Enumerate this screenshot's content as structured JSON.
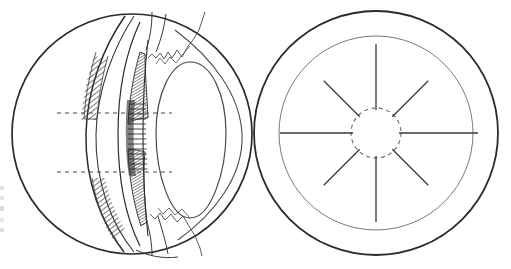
{
  "figure": {
    "caption": "",
    "background_color": "#ffffff",
    "ink_color": "#2b2b2b",
    "fine_ink_color": "#555555",
    "hatch_color": "#4a4a4a",
    "width": 511,
    "height": 269
  },
  "panels": [
    {
      "id": "left-panel",
      "name": "sagittal-section-of-eyeball",
      "label": "",
      "center": {
        "x": 132,
        "y": 134
      },
      "radius": 121,
      "elements": [
        {
          "name": "globe-outline",
          "type": "circle",
          "stroke": "#2b2b2b",
          "stroke_width": 1.6
        },
        {
          "name": "cornea-arc",
          "type": "arc",
          "stroke": "#2b2b2b",
          "stroke_width": 1.2
        },
        {
          "name": "anterior-chamber-arc",
          "type": "arc",
          "stroke": "#2b2b2b",
          "stroke_width": 1.1
        },
        {
          "name": "iris-hatched-band-superior",
          "type": "hatched-crescent",
          "hatch_angle_deg": 50
        },
        {
          "name": "iris-hatched-band-inferior",
          "type": "hatched-crescent",
          "hatch_angle_deg": 50
        },
        {
          "name": "ciliary-body-stipple-superior",
          "type": "stipple-wedge"
        },
        {
          "name": "ciliary-body-stipple-inferior",
          "type": "stipple-wedge"
        },
        {
          "name": "zonular-fiber-comb",
          "type": "fiber-bundle",
          "fiber_count": 30
        },
        {
          "name": "lens-outline",
          "type": "lens-ellipse",
          "stroke": "#4a4a4a"
        },
        {
          "name": "vitreous-boundary-arc",
          "type": "arc",
          "stroke": "#4a4a4a"
        },
        {
          "name": "optic-axis-marker-superior",
          "type": "dashed-line",
          "y": 113
        },
        {
          "name": "optic-axis-marker-inferior",
          "type": "dashed-line",
          "y": 172
        }
      ],
      "dashed_reference_lines": [
        {
          "name": "reference-line-upper",
          "y": 113,
          "x_start": 57,
          "x_end": 172
        },
        {
          "name": "reference-line-lower",
          "y": 172,
          "x_start": 57,
          "x_end": 172
        }
      ]
    },
    {
      "id": "right-panel",
      "name": "frontal-view-of-lens-and-ciliary-zonule",
      "label": "",
      "center": {
        "x": 376,
        "y": 133
      },
      "outer_radius": 122,
      "inner_radius": 97,
      "hub_radius": 25,
      "spoke_count": 8,
      "spoke_angles_deg": [
        0,
        45,
        90,
        135,
        180,
        225,
        270,
        315
      ],
      "elements": [
        {
          "name": "outer-ring-circle",
          "type": "circle",
          "stroke": "#2b2b2b",
          "stroke_width": 1.8
        },
        {
          "name": "inner-ring-circle",
          "type": "circle",
          "stroke": "#6a6a6a",
          "stroke_width": 0.9
        },
        {
          "name": "pupil-dashed-circle",
          "type": "dashed-circle",
          "stroke": "#6a6a6a",
          "stroke_width": 1.1
        },
        {
          "name": "radial-spokes",
          "type": "spokes",
          "stroke": "#3a3a3a",
          "stroke_width": 1.3
        }
      ]
    }
  ],
  "edge_artifacts": [
    {
      "name": "cropped-label-fragment-1",
      "top": 186,
      "height": 4
    },
    {
      "name": "cropped-label-fragment-2",
      "top": 196,
      "height": 4
    },
    {
      "name": "cropped-label-fragment-3",
      "top": 206,
      "height": 5
    },
    {
      "name": "cropped-label-fragment-4",
      "top": 218,
      "height": 4
    },
    {
      "name": "cropped-label-fragment-5",
      "top": 228,
      "height": 4
    }
  ]
}
